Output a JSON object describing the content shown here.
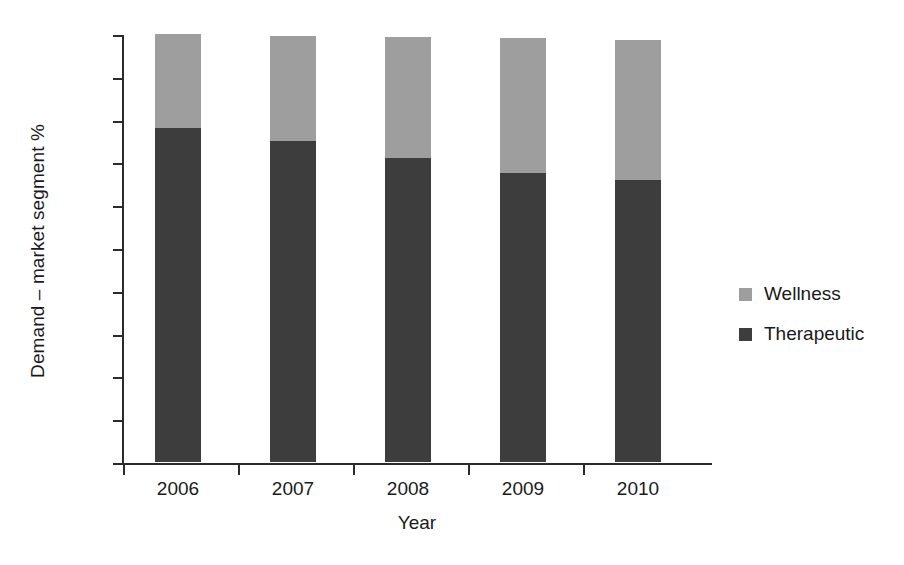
{
  "chart_data": {
    "type": "bar",
    "subtype": "stacked-vertical",
    "title": "",
    "xlabel": "Year",
    "ylabel": "Demand – market segment %",
    "categories": [
      "2006",
      "2007",
      "2008",
      "2009",
      "2010"
    ],
    "series": [
      {
        "name": "Therapeutic",
        "color": "#3d3d3d",
        "values": [
          78,
          75,
          71,
          67.5,
          66
        ]
      },
      {
        "name": "Wellness",
        "color": "#9e9e9e",
        "values": [
          22,
          24.6,
          28.2,
          31.5,
          32.6
        ]
      }
    ],
    "totals": [
      100,
      99.6,
      99.2,
      99.0,
      98.6
    ],
    "ylim": [
      0,
      100
    ],
    "ytick_values": [
      0,
      10,
      20,
      30,
      40,
      50,
      60,
      70,
      80,
      90,
      100
    ],
    "ytick_labels": [
      "0%",
      "10%",
      "20%",
      "30%",
      "40%",
      "50%",
      "60%",
      "70%",
      "80%",
      "90%",
      "100%"
    ],
    "grid": false,
    "legend_position": "right"
  },
  "axes": {
    "y_title": "Demand – market segment %",
    "x_title": "Year",
    "y_ticks": [
      {
        "label": "100%",
        "value": 100
      },
      {
        "label": "90%",
        "value": 90
      },
      {
        "label": "80%",
        "value": 80
      },
      {
        "label": "70%",
        "value": 70
      },
      {
        "label": "60%",
        "value": 60
      },
      {
        "label": "50%",
        "value": 50
      },
      {
        "label": "40%",
        "value": 40
      },
      {
        "label": "30%",
        "value": 30
      },
      {
        "label": "20%",
        "value": 20
      },
      {
        "label": "10%",
        "value": 10
      },
      {
        "label": "0%",
        "value": 0
      }
    ],
    "x_ticks": [
      "2006",
      "2007",
      "2008",
      "2009",
      "2010"
    ]
  },
  "legend": {
    "items": [
      {
        "label": "Wellness",
        "color": "#9e9e9e"
      },
      {
        "label": "Therapeutic",
        "color": "#3d3d3d"
      }
    ]
  }
}
